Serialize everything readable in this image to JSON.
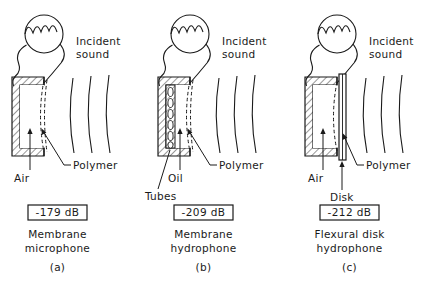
{
  "figure": {
    "background_color": "#ffffff",
    "line_color": "#1a1a1a",
    "text_color": "#1a1a1a"
  },
  "panels": [
    {
      "id": "a",
      "incident_sound_label": "Incident\nsound",
      "incident_sound_line1": "Incident",
      "incident_sound_line2": "sound",
      "sensor_icon": "fiber-coil-icon",
      "callouts": [
        {
          "name": "air",
          "label": "Air"
        },
        {
          "name": "polymer",
          "label": "Polymer"
        }
      ],
      "sensitivity": "-179 dB",
      "caption_line1": "Membrane",
      "caption_line2": "microphone",
      "caption_index": "(a)",
      "cavity_fill": "air",
      "wavefront_count": 3
    },
    {
      "id": "b",
      "incident_sound_line1": "Incident",
      "incident_sound_line2": "sound",
      "sensor_icon": "fiber-coil-icon",
      "callouts": [
        {
          "name": "tubes",
          "label": "Tubes"
        },
        {
          "name": "oil",
          "label": "Oil"
        },
        {
          "name": "polymer",
          "label": "Polymer"
        }
      ],
      "sensitivity": "-209 dB",
      "caption_line1": "Membrane",
      "caption_line2": "hydrophone",
      "caption_index": "(b)",
      "cavity_fill": "oil",
      "wavefront_count": 3
    },
    {
      "id": "c",
      "incident_sound_line1": "Incident",
      "incident_sound_line2": "sound",
      "sensor_icon": "fiber-coil-icon",
      "callouts": [
        {
          "name": "air",
          "label": "Air"
        },
        {
          "name": "disk",
          "label": "Disk"
        },
        {
          "name": "polymer",
          "label": "Polymer"
        }
      ],
      "sensitivity": "-212 dB",
      "caption_line1": "Flexural disk",
      "caption_line2": "hydrophone",
      "caption_index": "(c)",
      "cavity_fill": "air",
      "wavefront_count": 3
    }
  ]
}
